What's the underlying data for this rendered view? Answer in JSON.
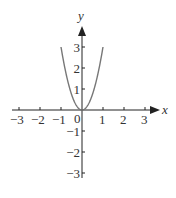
{
  "chart_data": {
    "type": "line",
    "title": "",
    "xlabel": "x",
    "ylabel": "y",
    "xlim": [
      -3,
      3
    ],
    "ylim": [
      -3,
      3
    ],
    "x_ticks": [
      "-3",
      "-2",
      "-1",
      "1",
      "2",
      "3"
    ],
    "y_ticks": [
      "3",
      "2",
      "1",
      "-1",
      "-2",
      "-3"
    ],
    "origin_label": "0",
    "grid": false,
    "series": [
      {
        "name": "y = 3x^2",
        "x": [
          -1,
          -0.75,
          -0.5,
          -0.25,
          0,
          0.25,
          0.5,
          0.75,
          1
        ],
        "y": [
          3,
          1.69,
          0.75,
          0.19,
          0,
          0.19,
          0.75,
          1.69,
          3
        ]
      }
    ],
    "colors": {
      "axis": "#222222",
      "curve": "#777777",
      "text": "#333333"
    }
  }
}
